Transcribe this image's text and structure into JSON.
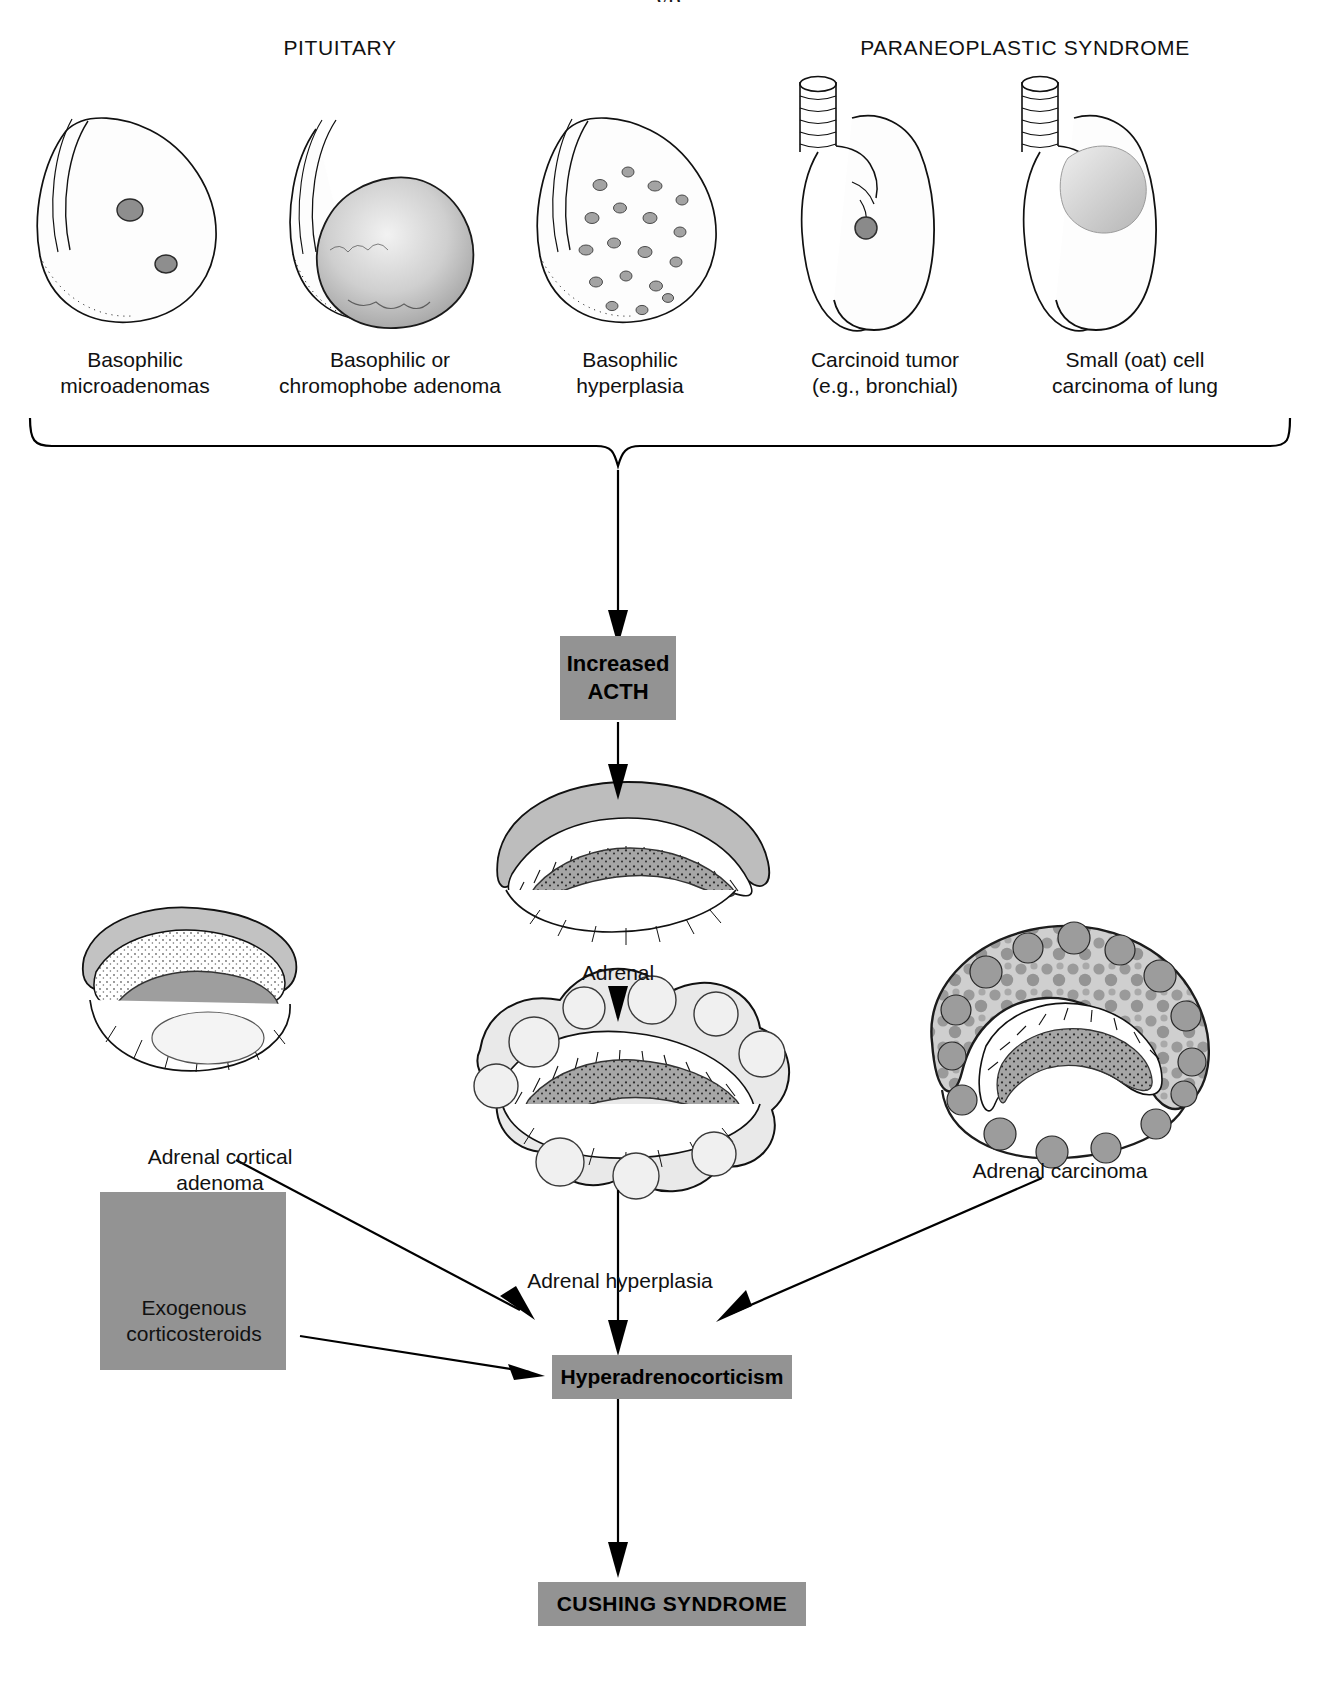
{
  "figure": {
    "partial_top_text": "yp",
    "section_headers": [
      {
        "label": "PITUITARY"
      },
      {
        "label": "PARANEOPLASTIC SYNDROME"
      }
    ]
  },
  "pituitary_items": [
    {
      "name": "basophilic-microadenomas",
      "line1": "Basophilic",
      "line2": "microadenomas"
    },
    {
      "name": "basophilic-chromophobe-adenoma",
      "line1": "Basophilic or",
      "line2": "chromophobe adenoma"
    },
    {
      "name": "basophilic-hyperplasia",
      "line1": "Basophilic",
      "line2": "hyperplasia"
    }
  ],
  "paraneoplastic_items": [
    {
      "name": "carcinoid-tumor",
      "line1": "Carcinoid tumor",
      "line2": "(e.g., bronchial)"
    },
    {
      "name": "small-oat-cell-carcinoma",
      "line1": "Small (oat) cell",
      "line2": "carcinoma of lung"
    }
  ],
  "nodes": {
    "increased_acth": {
      "line1": "Increased",
      "line2": "ACTH"
    },
    "hyperadrenocorticism": {
      "label": "Hyperadrenocorticism"
    },
    "cushing_syndrome": {
      "label": "CUSHING SYNDROME"
    },
    "exogenous_corticosteroids": {
      "line1": "Exogenous",
      "line2": "corticosteroids"
    }
  },
  "adrenal_labels": {
    "normal": "Adrenal",
    "cortical_adenoma_line1": "Adrenal cortical",
    "cortical_adenoma_line2": "adenoma",
    "hyperplasia": "Adrenal hyperplasia",
    "carcinoma": "Adrenal carcinoma"
  },
  "colors": {
    "box_fill": "#939393",
    "line": "#000000",
    "page_bg": "#ffffff",
    "tissue_mid": "#b9b9b9",
    "tissue_dark": "#8c8c8c"
  }
}
